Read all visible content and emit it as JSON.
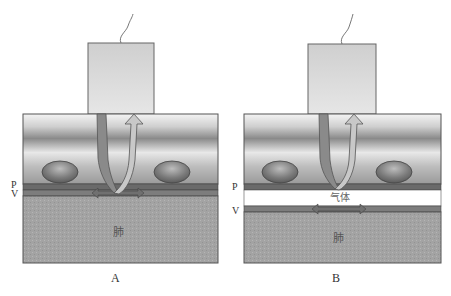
{
  "panels": [
    {
      "id": "A",
      "caption": "A",
      "layer_labels": {
        "pleura": "P",
        "visceral": "V"
      },
      "lung_label": "肺",
      "gas_label": null
    },
    {
      "id": "B",
      "caption": "B",
      "layer_labels": {
        "pleura": "P",
        "visceral": "V"
      },
      "lung_label": "肺",
      "gas_label": "气体"
    }
  ],
  "colors": {
    "probe": "#d4d4d4",
    "tissue_light": "#f2f2f2",
    "tissue_dark": "#8c8c8c",
    "pleura_band": "#6e6e6e",
    "lung": "#9e9e9e",
    "arrow_down": "#8a8a8a",
    "arrow_up": "#c8c8c8",
    "gas_gap": "#ffffff"
  }
}
